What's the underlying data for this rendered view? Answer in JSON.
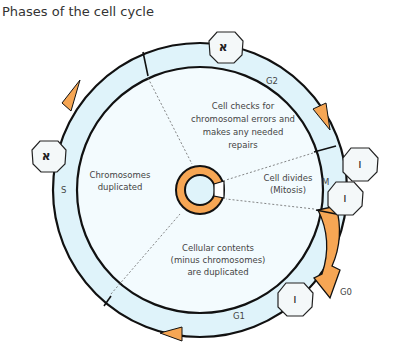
{
  "title": "Phases of the cell cycle",
  "colors": {
    "ring_fill": "#dff3fa",
    "inner_fill": "#f3fbfe",
    "arrow_orange": "#f6a654",
    "stroke": "#111111"
  },
  "phases": {
    "g2": "G2",
    "s": "S",
    "m": "M",
    "g1": "G1",
    "g0": "G0"
  },
  "descriptions": {
    "g2": [
      "Cell checks for",
      "chromosomal errors and",
      "makes any needed",
      "repairs"
    ],
    "s": [
      "Chromosomes",
      "duplicated"
    ],
    "m": [
      "Cell divides",
      "(Mitosis)"
    ],
    "g1": [
      "Cellular contents",
      "(minus chromosomes)",
      "are duplicated"
    ]
  },
  "cells": [
    {
      "phase": "G2",
      "glyph": "א"
    },
    {
      "phase": "S",
      "glyph": "א"
    },
    {
      "phase": "M-upper",
      "glyph": "ו"
    },
    {
      "phase": "M-lower",
      "glyph": "ו"
    },
    {
      "phase": "G1",
      "glyph": "ו"
    }
  ]
}
